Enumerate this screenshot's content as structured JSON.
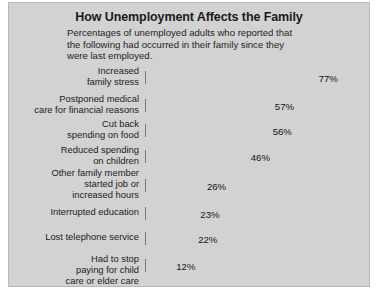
{
  "chart_data": {
    "type": "bar",
    "orientation": "horizontal",
    "title": "How Unemployment Affects the Family",
    "subtitle": "Percentages of unemployed adults who reported that the following had occurred in their family since they were last employed.",
    "xlabel": "",
    "ylabel": "",
    "xlim": [
      0,
      100
    ],
    "grid": false,
    "legend": null,
    "unit": "%",
    "categories": [
      "Increased family stress",
      "Postponed medical care for financial reasons",
      "Cut back spending on food",
      "Reduced spending on children",
      "Other family member started job or increased hours",
      "Interrupted education",
      "Lost telephone service",
      "Had to stop paying for child care or elder care"
    ],
    "values": [
      77,
      57,
      56,
      46,
      26,
      23,
      22,
      12
    ],
    "value_labels": [
      "77%",
      "57%",
      "56%",
      "46%",
      "26%",
      "23%",
      "22%",
      "12%"
    ],
    "category_lines": [
      [
        "Increased",
        "family stress"
      ],
      [
        "Postponed medical",
        "care for financial reasons"
      ],
      [
        "Cut back",
        "spending on food"
      ],
      [
        "Reduced spending",
        "on children"
      ],
      [
        "Other family member",
        "started job or",
        "increased hours"
      ],
      [
        "Interrupted education"
      ],
      [
        "Lost telephone service"
      ],
      [
        "Had to stop",
        "paying for child",
        "care or elder care"
      ]
    ]
  },
  "colors": {
    "panel_background": "#d2d2d2",
    "bar_fill": "#9d9d9d",
    "bar_highlight": "#ececec",
    "bar_edge": "#787878",
    "text": "#1a1a1a",
    "page_background": "#ffffff"
  }
}
